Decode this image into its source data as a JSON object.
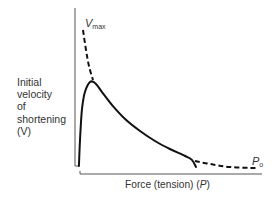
{
  "chart_data": {
    "type": "line",
    "title": "",
    "xlabel": "Force (tension) (P)",
    "ylabel": "Initial velocity of shortening (V)",
    "xlim": [
      0,
      1
    ],
    "ylim": [
      0,
      1
    ],
    "grid": false,
    "legend": null,
    "ticks": {
      "x": [],
      "y": []
    },
    "annotations": [
      {
        "text": "Vmax",
        "main": "V",
        "sub": "max",
        "at": "y-intercept of extrapolated curve"
      },
      {
        "text": "Po",
        "main": "P",
        "sub": "o",
        "at": "x-intercept of extrapolated curve"
      }
    ],
    "series": [
      {
        "name": "measured",
        "style": "solid",
        "points": [
          [
            -0.006,
            0.042
          ],
          [
            0.0,
            0.225
          ],
          [
            0.011,
            0.437
          ],
          [
            0.028,
            0.563
          ],
          [
            0.057,
            0.634
          ],
          [
            0.085,
            0.627
          ],
          [
            0.125,
            0.563
          ],
          [
            0.182,
            0.472
          ],
          [
            0.256,
            0.373
          ],
          [
            0.341,
            0.289
          ],
          [
            0.426,
            0.218
          ],
          [
            0.511,
            0.162
          ],
          [
            0.597,
            0.113
          ],
          [
            0.636,
            0.085
          ],
          [
            0.659,
            0.035
          ]
        ]
      },
      {
        "name": "extrapolation-to-Vmax",
        "style": "dashed",
        "points": [
          [
            0.017,
            1.0
          ],
          [
            0.034,
            0.859
          ],
          [
            0.051,
            0.746
          ],
          [
            0.074,
            0.648
          ]
        ]
      },
      {
        "name": "extrapolation-to-Po",
        "style": "dashed",
        "points": [
          [
            0.653,
            0.077
          ],
          [
            0.739,
            0.056
          ],
          [
            0.852,
            0.035
          ],
          [
            1.0,
            0.028
          ]
        ]
      }
    ]
  },
  "labels": {
    "y_axis_lines": [
      "Initial",
      "velocity",
      "of",
      "shortening",
      "(V)"
    ],
    "x_axis": {
      "prefix": "Force (tension) (",
      "var": "P",
      "suffix": ")"
    },
    "vmax": {
      "main": "V",
      "sub": "max"
    },
    "po": {
      "main": "P",
      "sub": "o"
    }
  }
}
